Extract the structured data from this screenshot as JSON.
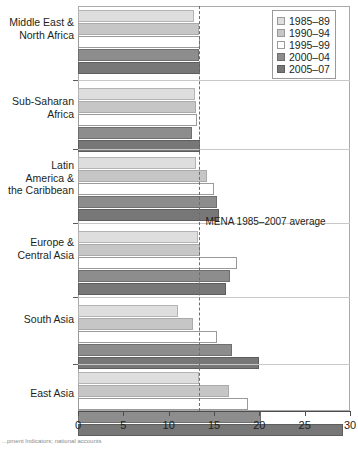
{
  "chart_data": {
    "type": "bar",
    "orientation": "horizontal",
    "title": "",
    "xlabel": "",
    "ylabel": "",
    "xlim": [
      0,
      30
    ],
    "xticks": [
      0,
      5,
      10,
      15,
      20,
      25,
      30
    ],
    "grid": false,
    "legend_position": "top-right",
    "categories": [
      "Middle East &\nNorth Africa",
      "Sub-Saharan\nAfrica",
      "Latin\nAmerica &\nthe Caribbean",
      "Europe &\nCentral Asia",
      "South Asia",
      "East Asia"
    ],
    "series": [
      {
        "name": "1985–89",
        "values": [
          12.8,
          12.9,
          13.0,
          13.2,
          11.0,
          13.3
        ]
      },
      {
        "name": "1990–94",
        "values": [
          13.4,
          13.0,
          14.2,
          13.5,
          12.7,
          16.7
        ]
      },
      {
        "name": "1995–99",
        "values": [
          13.5,
          13.1,
          15.0,
          17.5,
          15.3,
          18.8
        ]
      },
      {
        "name": "2000–04",
        "values": [
          13.4,
          12.6,
          15.3,
          16.8,
          17.0,
          20.2
        ]
      },
      {
        "name": "2005–07",
        "values": [
          13.5,
          13.5,
          15.6,
          16.3,
          20.0,
          29.2
        ]
      }
    ],
    "annotations": [
      {
        "name": "mena-average",
        "label": "MENA 1985–2007 average",
        "value": 13.4,
        "style": "dashed-vertical-line"
      }
    ]
  },
  "legend": {
    "items": [
      {
        "label": "1985–89",
        "swatch": "s0",
        "color": "#dedede"
      },
      {
        "label": "1990–94",
        "swatch": "s1",
        "color": "#c6c6c6"
      },
      {
        "label": "1995–99",
        "swatch": "s2",
        "color": "#ffffff"
      },
      {
        "label": "2000–04",
        "swatch": "s3",
        "color": "#8d8d8d"
      },
      {
        "label": "2005–07",
        "swatch": "s4",
        "color": "#777777"
      }
    ]
  },
  "axis": {
    "tick_labels": [
      "0",
      "5",
      "10",
      "15",
      "20",
      "25",
      "30"
    ]
  },
  "categories": {
    "c0_line1": "Middle East &",
    "c0_line2": "North Africa",
    "c1_line1": "Sub-Saharan",
    "c1_line2": "Africa",
    "c2_line1": "Latin",
    "c2_line2": "America &",
    "c2_line3": "the Caribbean",
    "c3_line1": "Europe &",
    "c3_line2": "Central Asia",
    "c4_line1": "South Asia",
    "c5_line1": "East Asia"
  },
  "annotation": {
    "mena_label": "MENA 1985–2007 average"
  },
  "source": {
    "caption": "...pment Indicators; national accounts"
  }
}
